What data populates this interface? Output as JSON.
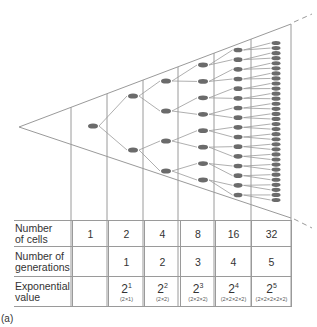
{
  "diagram": {
    "caption": "(a)",
    "colors": {
      "line": "#9a9a9a",
      "cell": "#6b6b6b",
      "text": "#333333"
    },
    "generations_drawn": 6,
    "cells_per_column": [
      1,
      2,
      4,
      8,
      16,
      32
    ]
  },
  "table": {
    "rows": [
      {
        "label": "Number of cells",
        "label_lines": [
          "Number",
          "of cells"
        ],
        "values": [
          "1",
          "2",
          "4",
          "8",
          "16",
          "32"
        ]
      },
      {
        "label": "Number of generations",
        "label_lines": [
          "Number of",
          "generations"
        ],
        "values": [
          "",
          "1",
          "2",
          "3",
          "4",
          "5"
        ]
      },
      {
        "label": "Exponential value",
        "label_lines": [
          "Exponential",
          "value"
        ],
        "values": [
          {
            "base": "",
            "exp": "",
            "expansion": ""
          },
          {
            "base": "2",
            "exp": "1",
            "expansion": "(2×1)"
          },
          {
            "base": "2",
            "exp": "2",
            "expansion": "(2×2)"
          },
          {
            "base": "2",
            "exp": "3",
            "expansion": "(2×2×2)"
          },
          {
            "base": "2",
            "exp": "4",
            "expansion": "(2×2×2×2)"
          },
          {
            "base": "2",
            "exp": "5",
            "expansion": "(2×2×2×2×2)"
          }
        ]
      }
    ]
  }
}
